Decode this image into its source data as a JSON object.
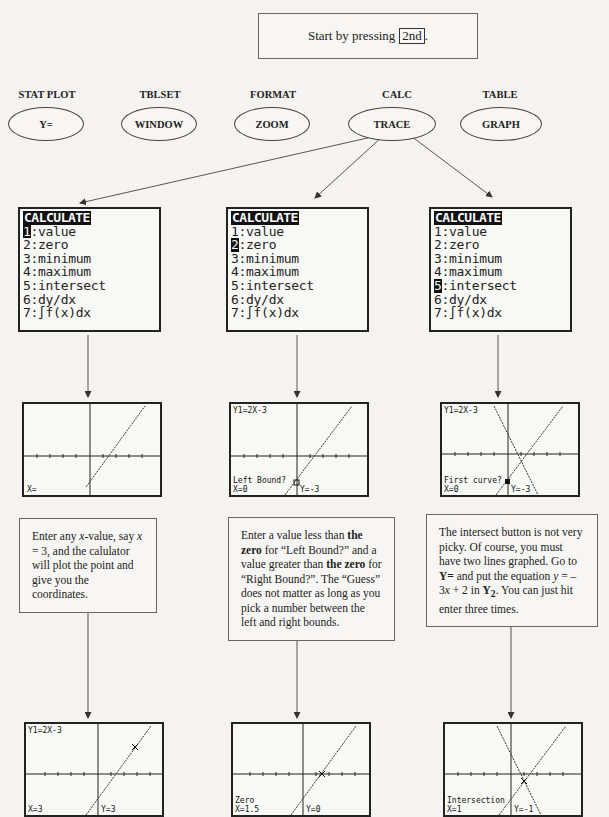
{
  "intro": {
    "text": "Start by pressing",
    "key": "2nd",
    "suffix": "."
  },
  "keys": [
    {
      "second": "STAT PLOT",
      "primary": "Y="
    },
    {
      "second": "TBLSET",
      "primary": "WINDOW"
    },
    {
      "second": "FORMAT",
      "primary": "ZOOM"
    },
    {
      "second": "CALC",
      "primary": "TRACE"
    },
    {
      "second": "TABLE",
      "primary": "GRAPH"
    }
  ],
  "calc_menu": {
    "title": "CALCULATE",
    "items": [
      {
        "num": "1",
        "label": "value"
      },
      {
        "num": "2",
        "label": "zero"
      },
      {
        "num": "3",
        "label": "minimum"
      },
      {
        "num": "4",
        "label": "maximum"
      },
      {
        "num": "5",
        "label": "intersect"
      },
      {
        "num": "6",
        "label": "dy/dx"
      },
      {
        "num": "7",
        "label": "∫f(x)dx"
      }
    ]
  },
  "columns": [
    {
      "selected_item": 1,
      "screen1": {
        "top": "",
        "bottom_left1": "",
        "bottom_left2": "X=",
        "bottom_right": ""
      },
      "note": {
        "parts": [
          {
            "t": "Enter any "
          },
          {
            "t": "x",
            "i": true
          },
          {
            "t": "-value, say "
          },
          {
            "t": "x",
            "i": true
          },
          {
            "t": " = 3, and the calulator will plot the point and give you the coordinates."
          }
        ]
      },
      "screen2": {
        "top": "Y1=2X-3",
        "bottom_left1": "",
        "bottom_left2": "X=3",
        "bottom_right": "Y=3"
      }
    },
    {
      "selected_item": 2,
      "screen1": {
        "top": "Y1=2X-3",
        "bottom_left1": "Left Bound?",
        "bottom_left2": "X=0",
        "bottom_right": "Y=-3"
      },
      "note": {
        "parts": [
          {
            "t": "Enter a value less than "
          },
          {
            "t": "the zero",
            "b": true
          },
          {
            "t": " for “Left Bound?” and a value greater than "
          },
          {
            "t": "the zero",
            "b": true
          },
          {
            "t": " for “Right Bound?”. The “Guess” does not matter as long as you pick a number between the left and right bounds."
          }
        ]
      },
      "screen2": {
        "top": "",
        "bottom_left1": "Zero",
        "bottom_left2": "X=1.5",
        "bottom_right": "Y=0"
      }
    },
    {
      "selected_item": 5,
      "screen1": {
        "top": "Y1=2X-3",
        "bottom_left1": "First curve?",
        "bottom_left2": "X=0",
        "bottom_right": "Y=-3"
      },
      "note": {
        "parts": [
          {
            "t": "The intersect button is not very picky. Of course, you must have two lines graphed. Go to "
          },
          {
            "t": "Y=",
            "b": true
          },
          {
            "t": " and put the equation "
          },
          {
            "t": "y",
            "i": true
          },
          {
            "t": " = –3"
          },
          {
            "t": "x",
            "i": true
          },
          {
            "t": " + 2 in "
          },
          {
            "t": "Y",
            "b": true
          },
          {
            "t": "2",
            "sub": true
          },
          {
            "t": ". You can just hit enter three times."
          }
        ]
      },
      "screen2": {
        "top": "",
        "bottom_left1": "Intersection",
        "bottom_left2": "X=1",
        "bottom_right": "Y=-1"
      }
    }
  ]
}
